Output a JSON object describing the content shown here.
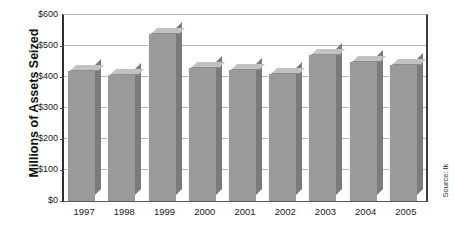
{
  "chart_data": {
    "type": "bar",
    "title": "",
    "xlabel": "",
    "ylabel": "Millions of Assets Seized",
    "ylim": [
      0,
      600
    ],
    "ytick_labels": [
      "$600",
      "$500",
      "$400",
      "$300",
      "$200",
      "$100",
      "$0"
    ],
    "ytick_values": [
      600,
      500,
      400,
      300,
      200,
      100,
      0
    ],
    "grid": true,
    "legend": "none",
    "categories": [
      "1997",
      "1998",
      "1999",
      "2000",
      "2001",
      "2002",
      "2003",
      "2004",
      "2005"
    ],
    "values": [
      420,
      408,
      540,
      428,
      423,
      409,
      470,
      447,
      440
    ],
    "series": [
      {
        "name": "Assets Seized",
        "values": [
          420,
          408,
          540,
          428,
          423,
          409,
          470,
          447,
          440
        ]
      }
    ],
    "annotations": [
      "Source: tk"
    ],
    "bar_color": "#9a9a9a",
    "bar_top_color": "#c2c2c2",
    "bar_side_color": "#7b7b7b",
    "grid_color": "#b4b4b4",
    "axis_color": "#2e2e2e"
  },
  "source_note": "Source: tk"
}
